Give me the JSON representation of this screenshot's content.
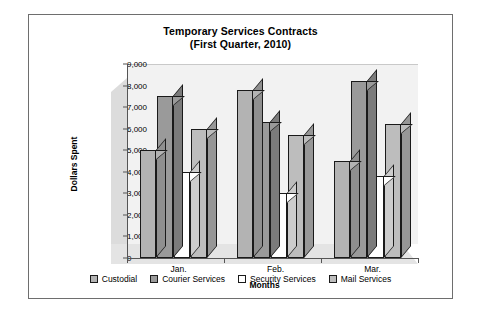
{
  "chart_data": {
    "type": "bar",
    "title": "Temporary Services Contracts",
    "subtitle": "(First Quarter, 2010)",
    "xlabel": "Months",
    "ylabel": "Dollars Spent",
    "categories": [
      "Jan.",
      "Feb.",
      "Mar."
    ],
    "ylim": [
      0,
      9000
    ],
    "ytick_step": 1000,
    "ytick_labels": [
      "0",
      "1,000",
      "2,000",
      "3,000",
      "4,000",
      "5,000",
      "6,000",
      "7,000",
      "8,000",
      "9,000"
    ],
    "grid": false,
    "legend_position": "bottom",
    "style": "3d-column",
    "series": [
      {
        "name": "Custodial",
        "color": "#b3b3b3",
        "values": [
          5000,
          7800,
          4500
        ]
      },
      {
        "name": "Courier Services",
        "color": "#9a9a9a",
        "values": [
          7500,
          6300,
          8200
        ]
      },
      {
        "name": "Security Services",
        "color": "#ffffff",
        "values": [
          4000,
          3000,
          3800
        ]
      },
      {
        "name": "Mail Services",
        "color": "#bdbdbd",
        "values": [
          6000,
          5700,
          6200
        ]
      }
    ]
  }
}
